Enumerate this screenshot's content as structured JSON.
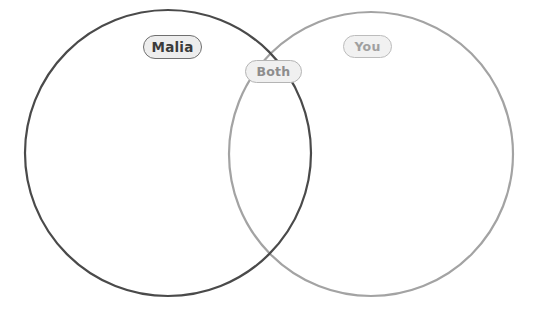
{
  "diagram": {
    "type": "venn",
    "title": "",
    "background_color": "#ffffff",
    "width": 543,
    "height": 318,
    "circles": [
      {
        "id": "left",
        "label": "Malia",
        "cx": 168,
        "cy": 153,
        "r": 143,
        "stroke_color": "#4a4a4a",
        "stroke_width": 2.2,
        "fill": "none"
      },
      {
        "id": "right",
        "label": "You",
        "cx": 371,
        "cy": 154,
        "r": 142,
        "stroke_color": "#a3a3a3",
        "stroke_width": 2.2,
        "fill": "none"
      }
    ],
    "labels": [
      {
        "id": "malia",
        "text": "Malia",
        "region": "left-only",
        "text_color": "#3b3b3b",
        "border_color": "#6f6f6f",
        "fill_color": "#ededed"
      },
      {
        "id": "both",
        "text": "Both",
        "region": "intersection",
        "text_color": "#8d8d8d",
        "border_color": "#b4b4b4",
        "fill_color": "#f0f0f0"
      },
      {
        "id": "you",
        "text": "You",
        "region": "right-only",
        "text_color": "#a0a0a0",
        "border_color": "#bcbcbc",
        "fill_color": "#f1f1f1"
      }
    ]
  }
}
